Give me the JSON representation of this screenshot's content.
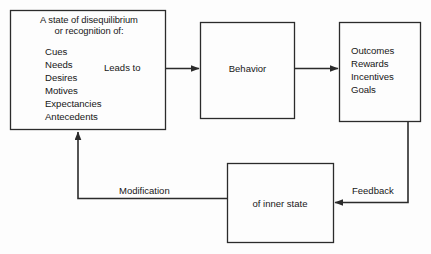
{
  "diagram": {
    "background_color": "#fdfdfd",
    "line_color": "#2b2b2b",
    "text_color": "#171717",
    "boxes": {
      "state": {
        "name": "state-of-disequilibrium-box",
        "heading_line_1": "A state of disequilibrium",
        "heading_line_2": "or recognition of:",
        "heading": "A state of disequilibrium\nor recognition of:",
        "items": [
          "Cues",
          "Needs",
          "Desires",
          "Motives",
          "Expectancies",
          "Antecedents"
        ],
        "items_text": "Cues\nNeeds\nDesires\nMotives\nExpectancies\nAntecedents"
      },
      "behavior": {
        "name": "behavior-box",
        "label": "Behavior"
      },
      "outcomes": {
        "name": "outcomes-box",
        "items": [
          "Outcomes",
          "Rewards",
          "Incentives",
          "Goals"
        ],
        "items_text": "Outcomes\nRewards\nIncentives\nGoals"
      },
      "inner_state": {
        "name": "inner-state-box",
        "label": "of inner state"
      }
    },
    "edge_labels": {
      "leads_to": "Leads to",
      "modification": "Modification",
      "feedback": "Feedback"
    }
  }
}
